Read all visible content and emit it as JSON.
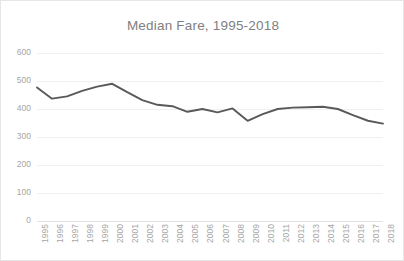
{
  "chart_data": {
    "type": "line",
    "title": "Median Fare, 1995-2018",
    "xlabel": "",
    "ylabel": "",
    "ylim": [
      0,
      600
    ],
    "yticks": [
      0,
      100,
      200,
      300,
      400,
      500,
      600
    ],
    "ytick_labels": [
      "0",
      "100",
      "200",
      "300",
      "400",
      "500",
      "600"
    ],
    "grid": true,
    "legend": false,
    "legend_position": "none",
    "line_color": "#595959",
    "categories": [
      "1995",
      "1996",
      "1997",
      "1998",
      "1999",
      "2000",
      "2001",
      "2002",
      "2003",
      "2004",
      "2005",
      "2006",
      "2007",
      "2008",
      "2009",
      "2010",
      "2011",
      "2012",
      "2013",
      "2014",
      "2015",
      "2016",
      "2017",
      "2018"
    ],
    "series": [
      {
        "name": "Median Fare",
        "values": [
          477,
          437,
          445,
          465,
          480,
          490,
          460,
          432,
          415,
          410,
          390,
          400,
          388,
          402,
          358,
          382,
          400,
          405,
          406,
          408,
          400,
          378,
          358,
          348
        ]
      }
    ]
  },
  "colors": {
    "title": "#808080",
    "tick_label": "#a6a6a6",
    "gridline": "#f0f0f0",
    "series": "#595959",
    "border": "#e6e6e6",
    "background": "#ffffff"
  }
}
